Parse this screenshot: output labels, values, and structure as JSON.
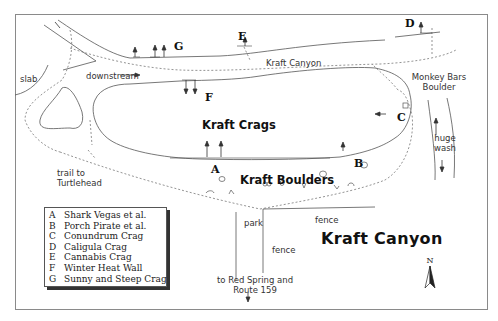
{
  "map": {
    "title": "Kraft Canyon",
    "areas": {
      "crags": "Kraft Crags",
      "boulders": "Kraft Boulders"
    },
    "crag_letters": {
      "A": "A",
      "B": "B",
      "C": "C",
      "D": "D",
      "E": "E",
      "F": "F",
      "G": "G"
    },
    "labels": {
      "slab": "slab",
      "downstream": "downstream",
      "kraft_canyon_trail": "Kraft Canyon",
      "monkey_bars_line1": "Monkey Bars",
      "monkey_bars_line2": "Boulder",
      "huge_wash_line1": "huge",
      "huge_wash_line2": "wash",
      "trail_turtlehead_line1": "trail to",
      "trail_turtlehead_line2": "Turtlehead",
      "park": "park",
      "fence_top": "fence",
      "fence_left": "fence",
      "red_spring_line1": "to Red Spring and",
      "red_spring_line2": "Route 159"
    },
    "north_label": "N",
    "colors": {
      "line": "#555555",
      "text": "#222222",
      "frame": "#8a8a8a"
    }
  },
  "legend": {
    "items": [
      {
        "key": "A",
        "name": "Shark Vegas et al."
      },
      {
        "key": "B",
        "name": "Porch Pirate et al."
      },
      {
        "key": "C",
        "name": "Conundrum Crag"
      },
      {
        "key": "D",
        "name": "Caligula Crag"
      },
      {
        "key": "E",
        "name": "Cannabis Crag"
      },
      {
        "key": "F",
        "name": "Winter Heat Wall"
      },
      {
        "key": "G",
        "name": "Sunny and Steep Crag"
      }
    ]
  }
}
